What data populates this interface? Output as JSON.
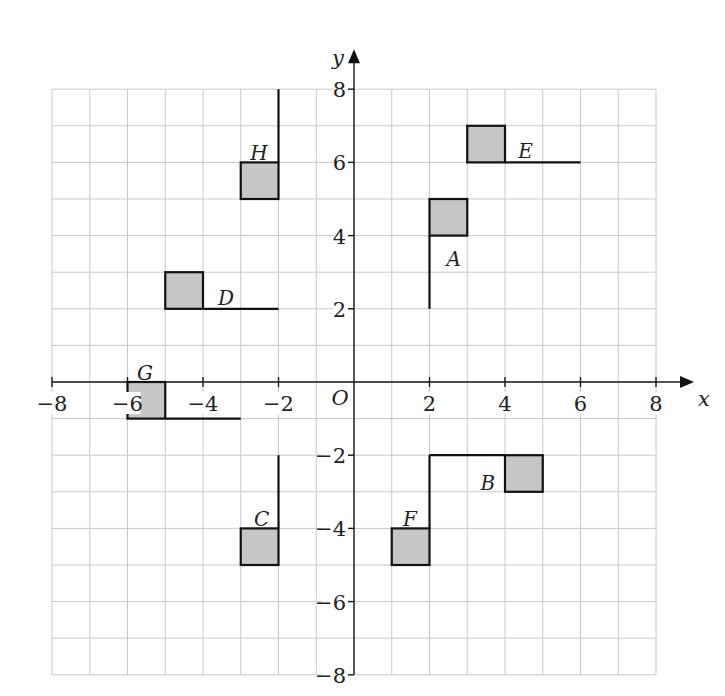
{
  "diagram": {
    "type": "coordinate-grid",
    "axes": {
      "x_label": "x",
      "y_label": "y",
      "origin_label": "O",
      "x_range": [
        -8,
        8
      ],
      "y_range": [
        -8,
        8
      ],
      "x_ticks": [
        -8,
        -6,
        -4,
        -2,
        2,
        4,
        6,
        8
      ],
      "y_ticks": [
        -8,
        -6,
        -4,
        -2,
        2,
        4,
        6,
        8
      ],
      "grid": true
    },
    "colors": {
      "shape_fill": "#c6c6c6",
      "shape_stroke": "#111111",
      "grid": "#c8c8c8",
      "axis": "#1a1a1a"
    },
    "flags": [
      {
        "label": "A",
        "square": [
          2,
          4,
          3,
          5
        ],
        "line": [
          [
            2,
            2
          ],
          [
            2,
            4
          ]
        ],
        "label_pos": [
          2.45,
          3.35
        ]
      },
      {
        "label": "B",
        "square": [
          4,
          -3,
          5,
          -2
        ],
        "line": [
          [
            2,
            -2
          ],
          [
            4,
            -2
          ]
        ],
        "label_pos": [
          3.35,
          -2.75
        ]
      },
      {
        "label": "C",
        "square": [
          -3,
          -5,
          -2,
          -4
        ],
        "line": [
          [
            -2,
            -4
          ],
          [
            -2,
            -2
          ]
        ],
        "label_pos": [
          -2.65,
          -3.75
        ]
      },
      {
        "label": "D",
        "square": [
          -5,
          2,
          -4,
          3
        ],
        "line": [
          [
            -4,
            2
          ],
          [
            -2,
            2
          ]
        ],
        "label_pos": [
          -3.6,
          2.3
        ]
      },
      {
        "label": "E",
        "square": [
          3,
          6,
          4,
          7
        ],
        "line": [
          [
            4,
            6
          ],
          [
            6,
            6
          ]
        ],
        "label_pos": [
          4.35,
          6.3
        ]
      },
      {
        "label": "F",
        "square": [
          1,
          -5,
          2,
          -4
        ],
        "line": [
          [
            2,
            -4
          ],
          [
            2,
            -2
          ]
        ],
        "label_pos": [
          1.3,
          -3.75
        ]
      },
      {
        "label": "G",
        "square": [
          -6,
          -1,
          -5,
          0
        ],
        "line": [
          [
            -5,
            -1
          ],
          [
            -3,
            -1
          ]
        ],
        "label_pos": [
          -5.75,
          0.25
        ]
      },
      {
        "label": "H",
        "square": [
          -3,
          5,
          -2,
          6
        ],
        "line": [
          [
            -2,
            6
          ],
          [
            -2,
            8
          ]
        ],
        "label_pos": [
          -2.75,
          6.25
        ]
      }
    ]
  }
}
